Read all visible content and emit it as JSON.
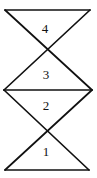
{
  "diagram": {
    "type": "stacked-hourglass-triangles",
    "background_color": "#ffffff",
    "line_color": "#111111",
    "triangles": [
      {
        "label": "4",
        "orientation": "down",
        "position": "top"
      },
      {
        "label": "3",
        "orientation": "up",
        "position": "upper-middle"
      },
      {
        "label": "2",
        "orientation": "down",
        "position": "lower-middle"
      },
      {
        "label": "1",
        "orientation": "up",
        "position": "bottom"
      }
    ]
  }
}
